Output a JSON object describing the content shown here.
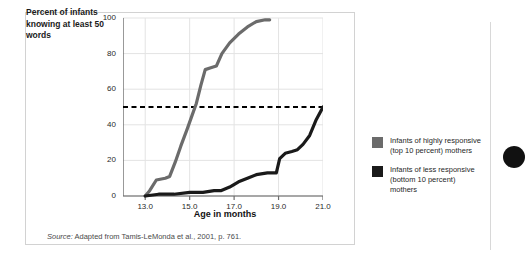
{
  "figure": {
    "y_axis_caption": "Percent of infants knowing at least 50 words",
    "x_axis_title": "Age in months",
    "source_prefix": "Source:",
    "source_text": " Adapted from Tamis-LeMonda et al., 2001, p. 761."
  },
  "legend": {
    "entries": [
      {
        "label": "Infants of highly responsive (top 10 percent) mothers",
        "color": "#6b6b6b"
      },
      {
        "label": "Infants of less responsive (bottom 10 percent) mothers",
        "color": "#1a1a1a"
      }
    ]
  },
  "chart_data": {
    "type": "line",
    "title": "",
    "xlabel": "Age in months",
    "ylabel": "Percent of infants knowing at least 50 words",
    "xlim": [
      12.0,
      21.0
    ],
    "ylim": [
      0,
      100
    ],
    "xticks": [
      "13.0",
      "15.0",
      "17.0",
      "19.0",
      "21.0"
    ],
    "xtick_values": [
      13.0,
      15.0,
      17.0,
      19.0,
      21.0
    ],
    "yticks": [
      "0",
      "20",
      "40",
      "60",
      "80",
      "100"
    ],
    "ytick_values": [
      0,
      20,
      40,
      60,
      80,
      100
    ],
    "grid": true,
    "legend_position": "right",
    "annotations": [
      {
        "type": "hline",
        "y": 50,
        "style": "dashed",
        "color": "#000000",
        "label": "50 percent reference line"
      }
    ],
    "series": [
      {
        "name": "Infants of highly responsive (top 10 percent) mothers",
        "color": "#6b6b6b",
        "points": [
          [
            13.0,
            0
          ],
          [
            13.2,
            3
          ],
          [
            13.5,
            9
          ],
          [
            13.9,
            10
          ],
          [
            14.1,
            11
          ],
          [
            14.35,
            19
          ],
          [
            14.6,
            28
          ],
          [
            14.9,
            38
          ],
          [
            15.1,
            45
          ],
          [
            15.3,
            52
          ],
          [
            15.5,
            62
          ],
          [
            15.7,
            71
          ],
          [
            15.95,
            72
          ],
          [
            16.2,
            73
          ],
          [
            16.45,
            80
          ],
          [
            16.8,
            86
          ],
          [
            17.2,
            91
          ],
          [
            17.6,
            95
          ],
          [
            18.0,
            98
          ],
          [
            18.4,
            99
          ],
          [
            18.6,
            99
          ]
        ]
      },
      {
        "name": "Infants of less responsive (bottom 10 percent) mothers",
        "color": "#1a1a1a",
        "points": [
          [
            13.0,
            0
          ],
          [
            13.6,
            1
          ],
          [
            14.3,
            1
          ],
          [
            15.0,
            2
          ],
          [
            15.6,
            2
          ],
          [
            16.1,
            3
          ],
          [
            16.4,
            3
          ],
          [
            16.8,
            5
          ],
          [
            17.2,
            8
          ],
          [
            17.6,
            10
          ],
          [
            18.0,
            12
          ],
          [
            18.5,
            13
          ],
          [
            18.9,
            13
          ],
          [
            19.05,
            21
          ],
          [
            19.3,
            24
          ],
          [
            19.6,
            25
          ],
          [
            19.85,
            26
          ],
          [
            20.1,
            29
          ],
          [
            20.4,
            34
          ],
          [
            20.7,
            43
          ],
          [
            21.0,
            50
          ]
        ]
      }
    ]
  }
}
